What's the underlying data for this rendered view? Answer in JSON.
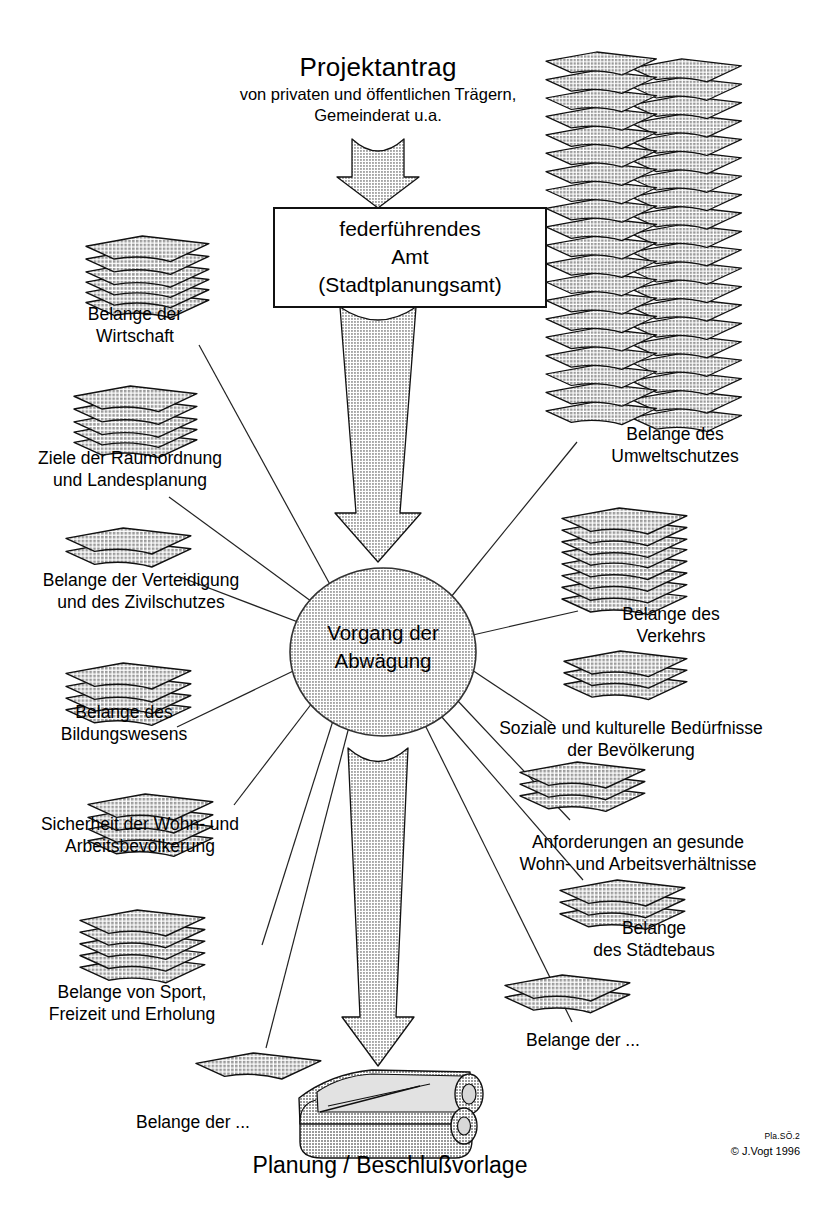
{
  "diagram": {
    "title_main": "Projektantrag",
    "title_sub_line1": "von privaten und öffentlichen Trägern,",
    "title_sub_line2": "Gemeinderat u.a.",
    "process_box": {
      "line1": "federführendes",
      "line2": "Amt",
      "line3": "(Stadtplanungsamt)"
    },
    "center_node": {
      "line1": "Vorgang der",
      "line2": "Abwägung"
    },
    "outcome": {
      "label": "Planung / Beschlußvorlage"
    },
    "credit": {
      "code": "Pla.SÖ.2",
      "copyright": "© J.Vogt 1996"
    },
    "concerns": [
      {
        "id": "wirtschaft",
        "line1": "Belange der",
        "line2": "Wirtschaft",
        "sheets": 6,
        "side": "left"
      },
      {
        "id": "raumordnung",
        "line1": "Ziele der Raumordnung",
        "line2": "und Landesplanung",
        "sheets": 5,
        "side": "left"
      },
      {
        "id": "verteidigung",
        "line1": "Belange der Verteidigung",
        "line2": "und des Zivilschutzes",
        "sheets": 2,
        "side": "left"
      },
      {
        "id": "bildungswesen",
        "line1": "Belange des",
        "line2": "Bildungswesens",
        "sheets": 4,
        "side": "left"
      },
      {
        "id": "sicherheit-wohn",
        "line1": "Sicherheit der Wohn- und",
        "line2": "Arbeitsbevölkerung",
        "sheets": 4,
        "side": "left"
      },
      {
        "id": "sport-freizeit",
        "line1": "Belange von Sport,",
        "line2": "Freizeit und Erholung",
        "sheets": 5,
        "side": "left"
      },
      {
        "id": "weitere-links",
        "line1": "Belange der ...",
        "line2": "",
        "sheets": 1,
        "side": "left"
      },
      {
        "id": "umweltschutz",
        "line1": "Belange des",
        "line2": "Umweltschutzes",
        "sheets": 40,
        "side": "right"
      },
      {
        "id": "verkehr",
        "line1": "Belange des",
        "line2": "Verkehrs",
        "sheets": 8,
        "side": "right"
      },
      {
        "id": "soziale-kulturelle",
        "line1": "Soziale und kulturelle Bedürfnisse",
        "line2": "der Bevölkerung",
        "sheets": 3,
        "side": "right"
      },
      {
        "id": "gesunde-wohn",
        "line1": "Anforderungen an gesunde",
        "line2": "Wohn- und Arbeitsverhältnisse",
        "sheets": 3,
        "side": "right"
      },
      {
        "id": "staedtebau",
        "line1": "Belange",
        "line2": "des Städtebaus",
        "sheets": 3,
        "side": "right"
      },
      {
        "id": "weitere-rechts",
        "line1": "Belange der ...",
        "line2": "",
        "sheets": 2,
        "side": "right"
      }
    ]
  },
  "colors": {
    "fill_gray": "#c8c8c8",
    "line": "#1a1a1a",
    "text": "#000000",
    "paper_fill": "#c4c4c4",
    "background": "#ffffff"
  }
}
